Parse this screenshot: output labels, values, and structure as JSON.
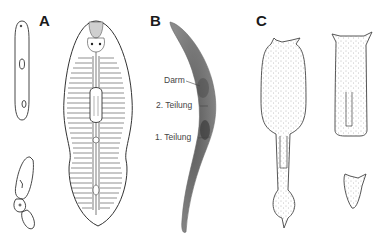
{
  "figure": {
    "panels": [
      {
        "id": "A",
        "label": "A"
      },
      {
        "id": "B",
        "label": "B"
      },
      {
        "id": "C",
        "label": "C"
      }
    ],
    "annotations_B": [
      {
        "text": "Darm"
      },
      {
        "text": "2. Teilung"
      },
      {
        "text": "1. Teilung"
      }
    ]
  }
}
